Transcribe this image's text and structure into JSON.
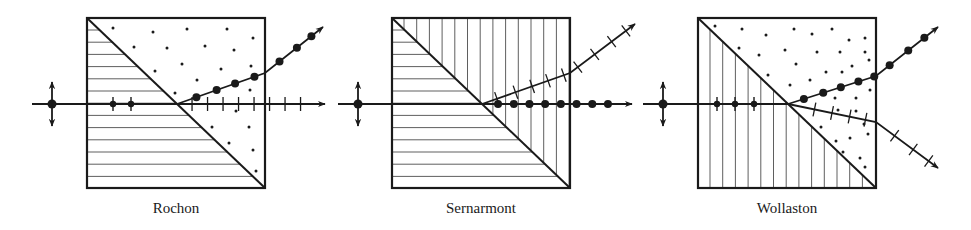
{
  "figure": {
    "ink_color": "#1a1a1a",
    "background_color": "#ffffff",
    "legend_semantics": {
      "dot-on-ray": "polarization perpendicular to page",
      "tick-on-ray": "polarization in plane of page",
      "horizontal-hatching": "optic axis in plane, horizontal",
      "vertical-hatching": "optic axis in plane, vertical",
      "dot-fill": "optic axis perpendicular to page"
    },
    "prisms": [
      {
        "id": "rochon",
        "label": "Rochon",
        "left_half_fill": "horizontal-hatching",
        "right_half_fill": "dot-fill",
        "input_polarization": "unpolarized (dot + double arrow)",
        "rays_inside_first_half": "dot-marked",
        "output_rays": [
          {
            "name": "undeviated",
            "polarization": "ticks",
            "deviation": "straight"
          },
          {
            "name": "deviated",
            "polarization": "dots",
            "deviation": "up"
          }
        ]
      },
      {
        "id": "sernarmont",
        "label": "Sernarmont",
        "left_half_fill": "horizontal-hatching",
        "right_half_fill": "vertical-hatching",
        "input_polarization": "unpolarized (dot + double arrow)",
        "rays_inside_first_half": "none",
        "output_rays": [
          {
            "name": "undeviated",
            "polarization": "dots",
            "deviation": "straight"
          },
          {
            "name": "deviated",
            "polarization": "ticks",
            "deviation": "up"
          }
        ]
      },
      {
        "id": "wollaston",
        "label": "Wollaston",
        "left_half_fill": "vertical-hatching",
        "right_half_fill": "dot-fill",
        "input_polarization": "unpolarized (dot + double arrow)",
        "rays_inside_first_half": "dot-marked",
        "output_rays": [
          {
            "name": "upper",
            "polarization": "dots",
            "deviation": "up"
          },
          {
            "name": "lower",
            "polarization": "ticks",
            "deviation": "down"
          }
        ]
      }
    ]
  }
}
